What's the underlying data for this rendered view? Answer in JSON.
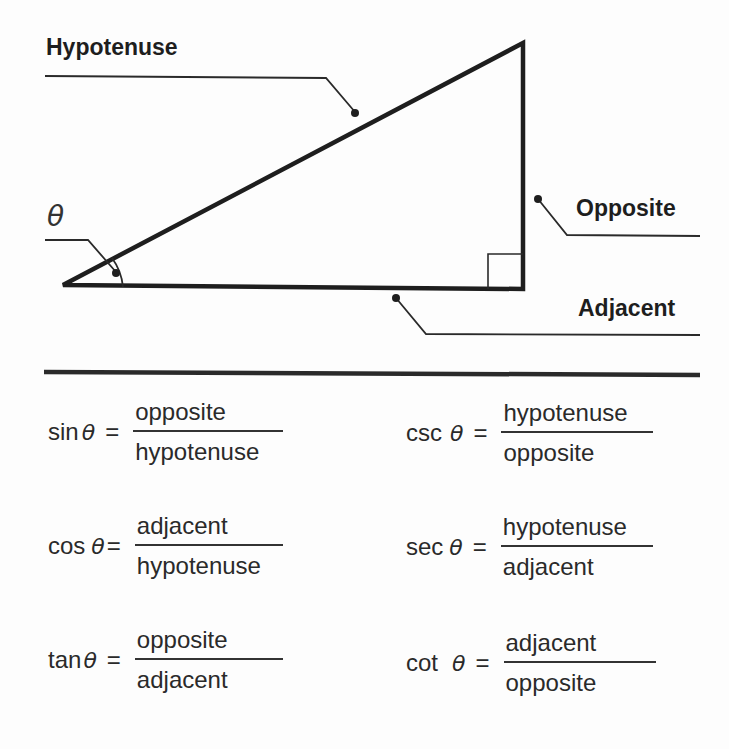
{
  "diagram": {
    "labels": {
      "hypotenuse": "Hypotenuse",
      "opposite": "Opposite",
      "adjacent": "Adjacent",
      "angle": "θ"
    },
    "colors": {
      "stroke": "#1e1e1e",
      "text": "#2a2a2a",
      "background": "#fdfdfd"
    }
  },
  "formulas": [
    {
      "fn": "sin",
      "theta": "θ",
      "eq": "=",
      "numerator": "opposite",
      "denominator": "hypotenuse"
    },
    {
      "fn": "cos",
      "theta": "θ",
      "eq": "=",
      "numerator": "adjacent",
      "denominator": "hypotenuse"
    },
    {
      "fn": "tan",
      "theta": "θ",
      "eq": "=",
      "numerator": "opposite",
      "denominator": "adjacent"
    },
    {
      "fn": "csc",
      "theta": "θ",
      "eq": "=",
      "numerator": "hypotenuse",
      "denominator": "opposite"
    },
    {
      "fn": "sec",
      "theta": "θ",
      "eq": "=",
      "numerator": "hypotenuse",
      "denominator": "adjacent"
    },
    {
      "fn": "cot",
      "theta": "θ",
      "eq": "=",
      "numerator": "adjacent",
      "denominator": "opposite"
    }
  ]
}
